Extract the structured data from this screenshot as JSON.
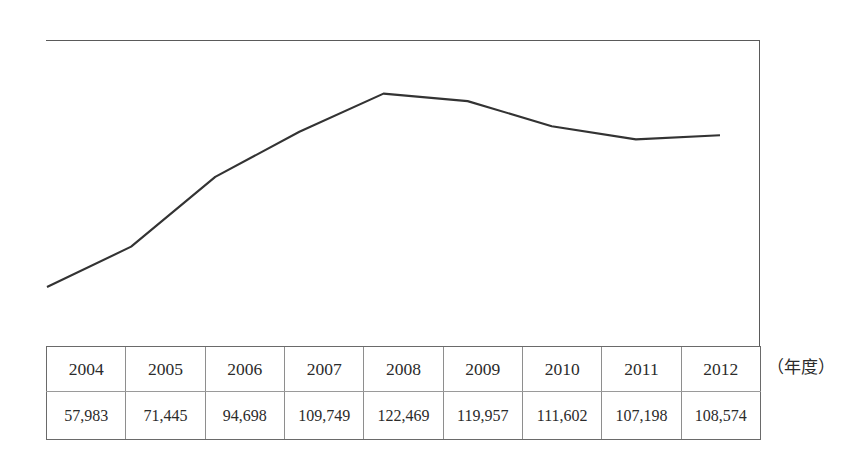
{
  "chart_data": {
    "type": "line",
    "title": "",
    "subtitle": "",
    "xlabel": "（年度）",
    "ylabel": "",
    "categories": [
      "2004",
      "2005",
      "2006",
      "2007",
      "2008",
      "2009",
      "2010",
      "2011",
      "2012"
    ],
    "values": [
      57983,
      71445,
      94698,
      109749,
      122469,
      119957,
      111602,
      107198,
      108574
    ],
    "value_labels": [
      "57,983",
      "71,445",
      "94,698",
      "109,749",
      "122,469",
      "119,957",
      "111,602",
      "107,198",
      "108,574"
    ],
    "series": [
      {
        "name": "",
        "values": [
          57983,
          71445,
          94698,
          109749,
          122469,
          119957,
          111602,
          107198,
          108574
        ],
        "color": "#333333",
        "marker": "none"
      }
    ],
    "ylim": [
      38000,
      140000
    ],
    "grid": false,
    "legend": false,
    "legend_position": "none",
    "axis_style": "top-and-right-border-only",
    "annotations": []
  },
  "table": {
    "row_years": [
      "2004",
      "2005",
      "2006",
      "2007",
      "2008",
      "2009",
      "2010",
      "2011",
      "2012"
    ],
    "row_values": [
      "57,983",
      "71,445",
      "94,698",
      "109,749",
      "122,469",
      "119,957",
      "111,602",
      "107,198",
      "108,574"
    ]
  },
  "caption": {
    "unit": "（年度）"
  },
  "colors": {
    "line": "#333333",
    "border": "#6a6a6a",
    "inner_rule": "#9a9a9a",
    "background": "#ffffff",
    "text": "#2b2b2b"
  }
}
